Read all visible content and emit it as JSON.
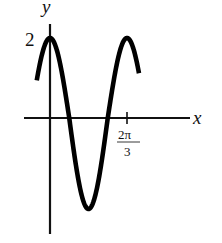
{
  "chart_data": {
    "type": "line",
    "title": "",
    "function": "y = 2cos(3x)",
    "xlabel": "x",
    "ylabel": "y",
    "x_ticks": [
      {
        "value": 2.0944,
        "label": "2π/3"
      }
    ],
    "y_ticks": [
      {
        "value": 2,
        "label": "2"
      }
    ],
    "xlim": [
      -0.35,
      2.75
    ],
    "ylim": [
      -2.6,
      2.4
    ],
    "grid": false,
    "legend": null,
    "series": [
      {
        "name": "curve",
        "color": "#000000",
        "x": [
          -0.35,
          -0.2,
          0,
          0.2,
          0.35,
          0.52,
          0.7,
          0.87,
          1.05,
          1.22,
          1.4,
          1.57,
          1.75,
          1.92,
          2.09,
          2.25,
          2.4
        ],
        "values": [
          0.99,
          1.65,
          2.0,
          1.65,
          0.99,
          0.02,
          -1.0,
          -1.72,
          -2.0,
          -1.74,
          -0.98,
          -0.01,
          1.02,
          1.73,
          2.0,
          1.75,
          1.22
        ]
      }
    ]
  },
  "labels": {
    "x_axis": "x",
    "y_axis": "y",
    "y_tick": "2",
    "x_tick_num": "2π",
    "x_tick_den": "3"
  }
}
